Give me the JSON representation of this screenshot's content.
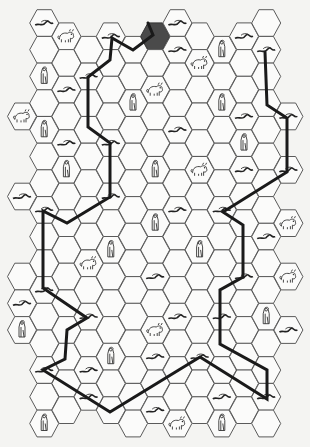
{
  "board": {
    "title": "Hex trail map",
    "hex_grid": {
      "orientation": "flat-top",
      "columns": 13,
      "col_x0": 22,
      "col_dx": 22.2,
      "odd_col_y0": 23,
      "even_col_y0": 36.3,
      "row_dy": 26.7,
      "hex_radius": 14.5
    },
    "column_rows": {
      "0": [
        3,
        6,
        9,
        10,
        11
      ],
      "1": [
        0,
        1,
        2,
        3,
        4,
        5,
        6,
        7,
        8,
        9,
        10,
        11,
        12,
        13,
        14,
        15
      ],
      "2": [
        0,
        1,
        2,
        3,
        4,
        5,
        6,
        7,
        8,
        9,
        10,
        11,
        12,
        13,
        14
      ],
      "3": [
        1,
        2,
        3,
        4,
        5,
        6,
        7,
        8,
        9,
        10,
        11,
        12,
        13,
        14
      ],
      "4": [
        0,
        1,
        2,
        3,
        4,
        5,
        6,
        7,
        8,
        9,
        10,
        11,
        12,
        13,
        14
      ],
      "5": [
        1,
        2,
        3,
        4,
        5,
        6,
        7,
        8,
        9,
        10,
        11,
        12,
        13,
        14,
        15
      ],
      "6": [
        0,
        1,
        2,
        3,
        4,
        5,
        6,
        7,
        8,
        9,
        10,
        11,
        12,
        13,
        14
      ],
      "7": [
        0,
        1,
        2,
        3,
        4,
        5,
        6,
        7,
        8,
        9,
        10,
        11,
        12,
        13,
        14,
        15
      ],
      "8": [
        0,
        1,
        2,
        3,
        4,
        5,
        6,
        7,
        8,
        9,
        10,
        11,
        12,
        13,
        14
      ],
      "9": [
        1,
        2,
        3,
        4,
        5,
        6,
        7,
        8,
        9,
        10,
        11,
        12,
        13,
        14,
        15
      ],
      "10": [
        0,
        1,
        2,
        3,
        4,
        5,
        6,
        7,
        8,
        9,
        10,
        11,
        12,
        13,
        14
      ],
      "11": [
        0,
        1,
        2,
        3,
        4,
        5,
        6,
        7,
        8,
        9,
        10,
        11,
        12,
        13,
        14,
        15
      ],
      "12": [
        3,
        5,
        7,
        9,
        11
      ]
    },
    "start_hex": {
      "col": 6,
      "row": 0,
      "color": "#4a4a4a"
    },
    "icons": [
      {
        "col": 1,
        "row": 0,
        "type": "serpent"
      },
      {
        "col": 7,
        "row": 0,
        "type": "serpent"
      },
      {
        "col": 2,
        "row": 0,
        "type": "beast"
      },
      {
        "col": 4,
        "row": 0,
        "type": "serpent"
      },
      {
        "col": 10,
        "row": 0,
        "type": "serpent"
      },
      {
        "col": 7,
        "row": 1,
        "type": "serpent"
      },
      {
        "col": 9,
        "row": 1,
        "type": "figure"
      },
      {
        "col": 11,
        "row": 1,
        "type": "serpent"
      },
      {
        "col": 8,
        "row": 1,
        "type": "beast"
      },
      {
        "col": 1,
        "row": 2,
        "type": "figure"
      },
      {
        "col": 3,
        "row": 2,
        "type": "serpent"
      },
      {
        "col": 2,
        "row": 2,
        "type": "serpent"
      },
      {
        "col": 6,
        "row": 2,
        "type": "beast"
      },
      {
        "col": 5,
        "row": 3,
        "type": "figure"
      },
      {
        "col": 9,
        "row": 3,
        "type": "figure"
      },
      {
        "col": 0,
        "row": 3,
        "type": "beast"
      },
      {
        "col": 1,
        "row": 4,
        "type": "figure"
      },
      {
        "col": 10,
        "row": 3,
        "type": "serpent"
      },
      {
        "col": 12,
        "row": 3,
        "type": "serpent"
      },
      {
        "col": 2,
        "row": 4,
        "type": "serpent"
      },
      {
        "col": 4,
        "row": 4,
        "type": "serpent"
      },
      {
        "col": 7,
        "row": 4,
        "type": "serpent"
      },
      {
        "col": 10,
        "row": 4,
        "type": "figure"
      },
      {
        "col": 2,
        "row": 5,
        "type": "figure"
      },
      {
        "col": 6,
        "row": 5,
        "type": "figure"
      },
      {
        "col": 8,
        "row": 5,
        "type": "beast"
      },
      {
        "col": 10,
        "row": 5,
        "type": "serpent"
      },
      {
        "col": 12,
        "row": 5,
        "type": "serpent"
      },
      {
        "col": 0,
        "row": 6,
        "type": "serpent"
      },
      {
        "col": 4,
        "row": 6,
        "type": "serpent"
      },
      {
        "col": 1,
        "row": 7,
        "type": "serpent"
      },
      {
        "col": 7,
        "row": 7,
        "type": "serpent"
      },
      {
        "col": 9,
        "row": 7,
        "type": "serpent"
      },
      {
        "col": 6,
        "row": 7,
        "type": "figure"
      },
      {
        "col": 12,
        "row": 7,
        "type": "beast"
      },
      {
        "col": 11,
        "row": 8,
        "type": "serpent"
      },
      {
        "col": 4,
        "row": 8,
        "type": "figure"
      },
      {
        "col": 8,
        "row": 8,
        "type": "figure"
      },
      {
        "col": 3,
        "row": 9,
        "type": "beast"
      },
      {
        "col": 6,
        "row": 9,
        "type": "serpent"
      },
      {
        "col": 10,
        "row": 9,
        "type": "serpent"
      },
      {
        "col": 12,
        "row": 9,
        "type": "beast"
      },
      {
        "col": 1,
        "row": 10,
        "type": "serpent"
      },
      {
        "col": 0,
        "row": 10,
        "type": "serpent"
      },
      {
        "col": 3,
        "row": 11,
        "type": "serpent"
      },
      {
        "col": 7,
        "row": 11,
        "type": "serpent"
      },
      {
        "col": 9,
        "row": 11,
        "type": "serpent"
      },
      {
        "col": 11,
        "row": 11,
        "type": "figure"
      },
      {
        "col": 0,
        "row": 11,
        "type": "figure"
      },
      {
        "col": 6,
        "row": 11,
        "type": "beast"
      },
      {
        "col": 12,
        "row": 11,
        "type": "serpent"
      },
      {
        "col": 4,
        "row": 12,
        "type": "figure"
      },
      {
        "col": 6,
        "row": 12,
        "type": "serpent"
      },
      {
        "col": 8,
        "row": 12,
        "type": "serpent"
      },
      {
        "col": 1,
        "row": 13,
        "type": "serpent"
      },
      {
        "col": 3,
        "row": 13,
        "type": "serpent"
      },
      {
        "col": 3,
        "row": 14,
        "type": "serpent"
      },
      {
        "col": 9,
        "row": 14,
        "type": "serpent"
      },
      {
        "col": 11,
        "row": 14,
        "type": "serpent"
      },
      {
        "col": 6,
        "row": 14,
        "type": "serpent"
      },
      {
        "col": 1,
        "row": 15,
        "type": "figure"
      },
      {
        "col": 7,
        "row": 15,
        "type": "beast"
      },
      {
        "col": 9,
        "row": 15,
        "type": "figure"
      }
    ],
    "route": {
      "color": "#1a1a1a",
      "points": [
        [
          148,
          23
        ],
        [
          153,
          35
        ],
        [
          133,
          50
        ],
        [
          112,
          38
        ],
        [
          110,
          60
        ],
        [
          88,
          77
        ],
        [
          88,
          127
        ],
        [
          110,
          143
        ],
        [
          110,
          197
        ],
        [
          67,
          223
        ],
        [
          43,
          211
        ],
        [
          43,
          288
        ],
        [
          87,
          318
        ],
        [
          67,
          330
        ],
        [
          65,
          359
        ],
        [
          43,
          370
        ],
        [
          110,
          412
        ],
        [
          200,
          357
        ],
        [
          267,
          399
        ],
        [
          267,
          370
        ],
        [
          220,
          344
        ],
        [
          220,
          290
        ],
        [
          243,
          277
        ],
        [
          243,
          225
        ],
        [
          223,
          212
        ],
        [
          287,
          172
        ],
        [
          287,
          118
        ],
        [
          267,
          105
        ],
        [
          265,
          52
        ]
      ]
    }
  }
}
